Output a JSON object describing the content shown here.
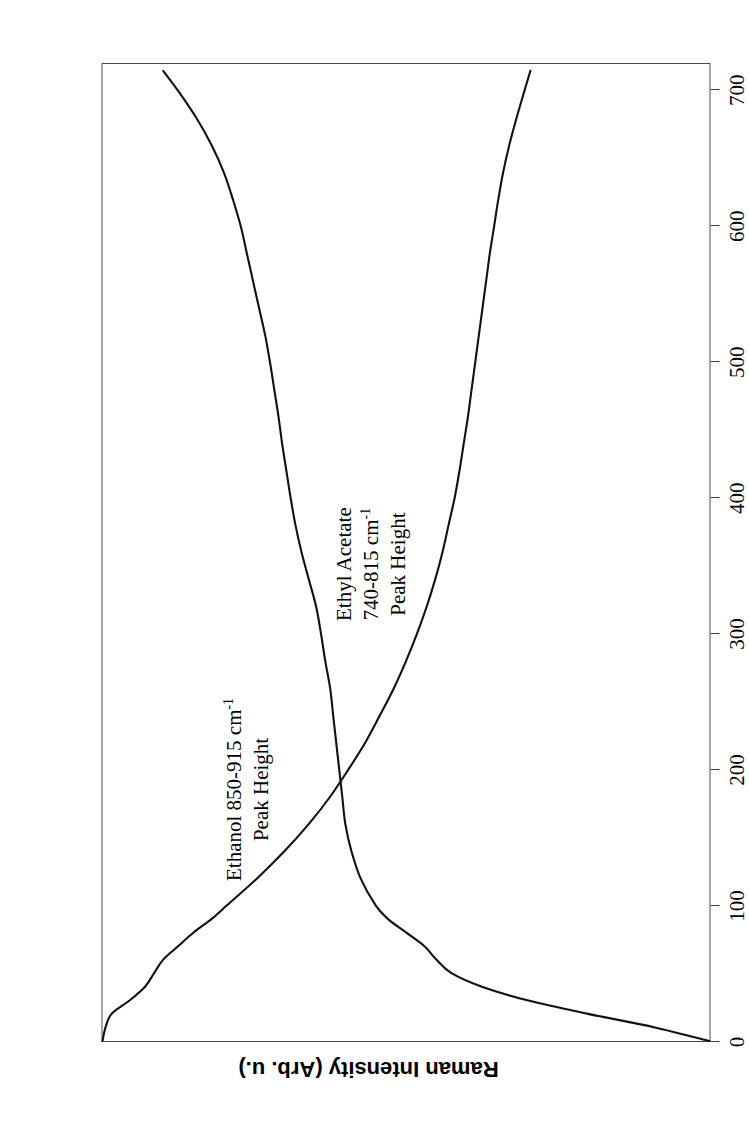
{
  "figure": {
    "orientation": "rotated-90-ccw",
    "background_color": "#ffffff",
    "frame_color": "#4a4a4a",
    "curve_color": "#111111"
  },
  "axes": {
    "x_title": "Time (s)",
    "y_title": "Raman Intensity (Arb. u.)",
    "x_ticks": [
      "0",
      "100",
      "200",
      "300",
      "400",
      "500",
      "600",
      "700"
    ],
    "y_ticks": []
  },
  "annotations": {
    "ethanol": {
      "line1": "Ethanol 850-915 cm",
      "sup1": "-1",
      "line2": "Peak Height"
    },
    "ethyl_acetate": {
      "line1": "Ethyl Acetate",
      "line2": "740-815 cm",
      "sup2": "-1",
      "line3": "Peak Height"
    }
  },
  "chart_data": {
    "type": "line",
    "title": "",
    "xlabel": "Time (s)",
    "ylabel": "Raman Intensity (Arb. u.)",
    "xlim": [
      0,
      720
    ],
    "ylim": [
      0,
      1
    ],
    "grid": false,
    "legend": "in-plot annotations",
    "x": [
      0,
      10,
      20,
      30,
      40,
      50,
      60,
      70,
      80,
      90,
      100,
      120,
      140,
      160,
      180,
      200,
      220,
      240,
      260,
      280,
      300,
      320,
      340,
      360,
      380,
      400,
      420,
      440,
      460,
      480,
      500,
      520,
      540,
      560,
      580,
      600,
      620,
      640,
      660,
      680,
      700,
      715
    ],
    "series": [
      {
        "name": "Ethanol 850-915 cm-1 Peak Height",
        "description": "Rises steeply from zero over the first ~100 s, then increases slowly and steadily, reaching maximum at the end of the run.",
        "values": [
          0.0,
          0.09,
          0.2,
          0.3,
          0.375,
          0.425,
          0.45,
          0.47,
          0.5,
          0.53,
          0.55,
          0.575,
          0.59,
          0.6,
          0.605,
          0.61,
          0.615,
          0.62,
          0.625,
          0.633,
          0.64,
          0.648,
          0.66,
          0.672,
          0.682,
          0.69,
          0.697,
          0.704,
          0.71,
          0.717,
          0.724,
          0.732,
          0.742,
          0.752,
          0.762,
          0.772,
          0.785,
          0.8,
          0.82,
          0.845,
          0.875,
          0.9
        ]
      },
      {
        "name": "Ethyl Acetate 740-815 cm-1 Peak Height",
        "description": "Starts at maximum, holds briefly, then decays steeply through the first ~200 s and continues a slow decline toward a low plateau at the end of the run.",
        "values": [
          1.0,
          0.995,
          0.985,
          0.955,
          0.93,
          0.915,
          0.9,
          0.875,
          0.85,
          0.82,
          0.795,
          0.745,
          0.7,
          0.66,
          0.625,
          0.595,
          0.567,
          0.543,
          0.52,
          0.5,
          0.482,
          0.466,
          0.452,
          0.44,
          0.43,
          0.42,
          0.412,
          0.405,
          0.398,
          0.392,
          0.386,
          0.38,
          0.374,
          0.368,
          0.362,
          0.355,
          0.348,
          0.34,
          0.33,
          0.318,
          0.305,
          0.295
        ]
      }
    ]
  }
}
